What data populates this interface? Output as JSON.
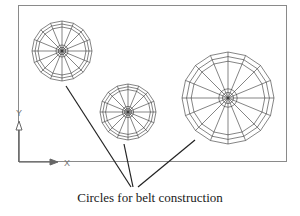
{
  "figure": {
    "caption": "Circles for belt construction",
    "frame": {
      "x": 18,
      "y": 5,
      "width": 269,
      "height": 157,
      "color": "#8a8a8a"
    },
    "ucs_icon": {
      "x_label": "X",
      "y_label": "Y",
      "color": "#666666"
    },
    "circles": [
      {
        "name": "small-circle",
        "cx": 62,
        "cy": 51,
        "r": 30,
        "rings": 3,
        "spokes": 16
      },
      {
        "name": "medium-circle",
        "cx": 128,
        "cy": 112,
        "r": 28,
        "rings": 3,
        "spokes": 16
      },
      {
        "name": "large-circle",
        "cx": 228,
        "cy": 98,
        "r": 46,
        "rings": 3,
        "spokes": 16
      }
    ],
    "leader_target": {
      "x": 133,
      "y": 188
    },
    "line_color": "#444444"
  }
}
